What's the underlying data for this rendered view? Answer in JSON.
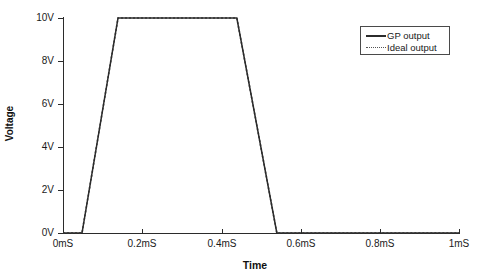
{
  "chart_data": {
    "type": "line",
    "title": "",
    "xlabel": "Time",
    "ylabel": "Voltage",
    "xlim": [
      0,
      1
    ],
    "ylim": [
      0,
      10
    ],
    "grid": false,
    "legend_position": "top-right",
    "x_tick_labels": [
      "0mS",
      "0.2mS",
      "0.4mS",
      "0.6mS",
      "0.8mS",
      "1mS"
    ],
    "x_tick_values": [
      0,
      0.2,
      0.4,
      0.6,
      0.8,
      1
    ],
    "y_tick_labels": [
      "0V",
      "2V",
      "4V",
      "6V",
      "8V",
      "10V"
    ],
    "y_tick_values": [
      0,
      2,
      4,
      6,
      8,
      10
    ],
    "series": [
      {
        "name": "GP output",
        "style": "solid",
        "color": "#2b2b2b",
        "x": [
          0,
          0.048,
          0.139,
          0.439,
          0.54,
          1.0
        ],
        "y": [
          0,
          0,
          10,
          10,
          0,
          0
        ]
      },
      {
        "name": "Ideal output",
        "style": "dotted",
        "color": "#555555",
        "x": [
          0,
          0.048,
          0.139,
          0.439,
          0.54,
          1.0
        ],
        "y": [
          0,
          0,
          10,
          10,
          0,
          0
        ]
      }
    ],
    "legend": [
      {
        "label": "GP output",
        "style": "solid"
      },
      {
        "label": "Ideal output",
        "style": "dotted"
      }
    ]
  }
}
